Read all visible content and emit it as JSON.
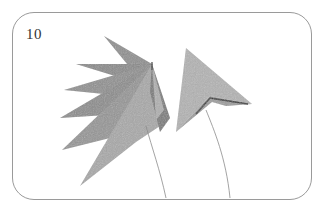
{
  "diagram": {
    "step_number": "10",
    "frame": {
      "border_color": "#9a9a9a",
      "background": "#ffffff"
    },
    "colors": {
      "paper_dark": "#8a8a8a",
      "paper_mid": "#a3a3a3",
      "paper_light": "#bdbdbd",
      "fold_line": "#2a2a2a",
      "stem_line": "#8c8c8c"
    },
    "figures": [
      {
        "id": "fan-star",
        "description": "fan-shaped folded paper with multiple spikes radiating from a top-right pivot"
      },
      {
        "id": "triangle-kite",
        "description": "single triangular folded piece with inner fold crease"
      }
    ]
  }
}
